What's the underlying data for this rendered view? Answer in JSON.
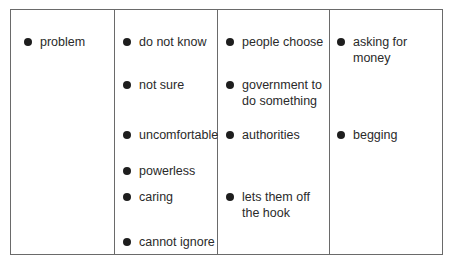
{
  "columns": [
    {
      "items": [
        "problem"
      ]
    },
    {
      "items": [
        "do not know",
        "not sure",
        "uncomfortable",
        "powerless",
        "caring",
        "cannot ignore"
      ]
    },
    {
      "items": [
        "people choose",
        "government to do something",
        "authorities",
        "lets them off the hook"
      ]
    },
    {
      "items": [
        "asking for money",
        "begging"
      ]
    }
  ],
  "cells": {
    "c0": {
      "i0": {
        "l1": "problem"
      }
    },
    "c1": {
      "i0": {
        "l1": "do not know"
      },
      "i1": {
        "l1": "not sure"
      },
      "i2": {
        "l1": "uncomfortable"
      },
      "i3": {
        "l1": "powerless"
      },
      "i4": {
        "l1": "caring"
      },
      "i5": {
        "l1": "cannot ignore"
      }
    },
    "c2": {
      "i0": {
        "l1": "people choose"
      },
      "i1": {
        "l1": "government to",
        "l2": "do something"
      },
      "i2": {
        "l1": "authorities"
      },
      "i3": {
        "l1": "lets them off",
        "l2": "the hook"
      }
    },
    "c3": {
      "i0": {
        "l1": "asking for",
        "l2": "money"
      },
      "i1": {
        "l1": "begging"
      }
    }
  },
  "colors": {
    "border": "#6a6a6a",
    "text": "#2a2a2a",
    "bullet": "#1e1e1e"
  }
}
